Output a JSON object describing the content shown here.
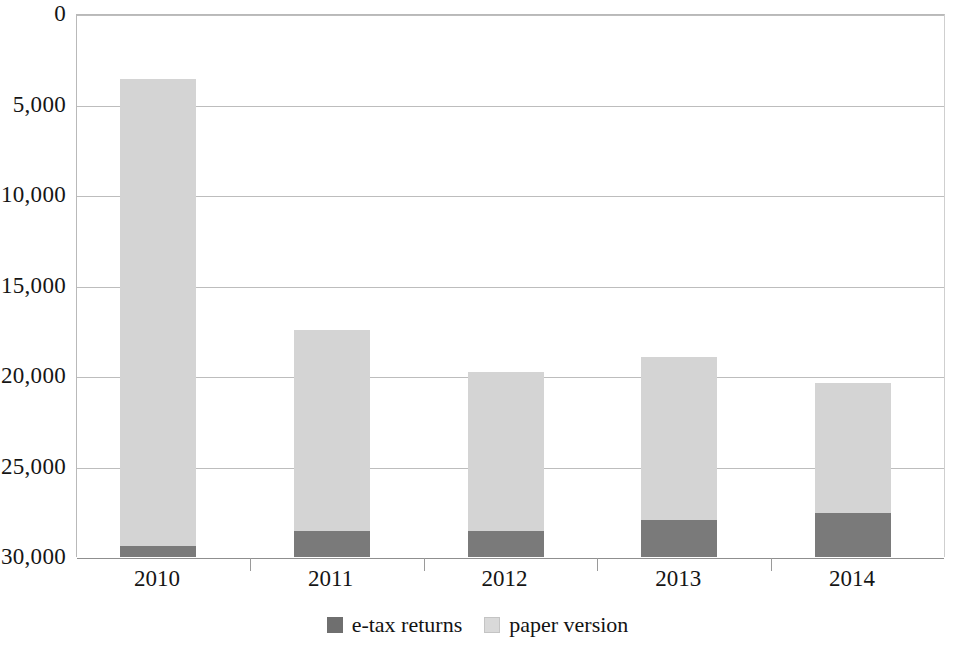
{
  "chart_data": {
    "type": "bar",
    "subtype": "stacked-bar",
    "title": "",
    "subtitle": "",
    "xlabel": "",
    "ylabel": "",
    "categories": [
      "2010",
      "2011",
      "2012",
      "2013",
      "2014"
    ],
    "series": [
      {
        "name": "e-tax returns",
        "color": "#7a7a7a",
        "values": [
          600,
          1440,
          1440,
          2040,
          2430
        ]
      },
      {
        "name": "paper version",
        "color": "#d4d4d4",
        "values": [
          25800,
          11100,
          8780,
          9010,
          7180
        ]
      }
    ],
    "totals": [
      26400,
      12540,
      10220,
      11050,
      9610
    ],
    "ylim": [
      0,
      30000
    ],
    "ytick_values": [
      0,
      5000,
      10000,
      15000,
      20000,
      25000,
      30000
    ],
    "ytick_labels": [
      "0",
      "5,000",
      "10,000",
      "15,000",
      "20,000",
      "25,000",
      "30,000"
    ],
    "grid": true,
    "legend_position": "bottom",
    "legend_entries": [
      {
        "label": "e-tax returns",
        "swatch": "etax"
      },
      {
        "label": "paper version",
        "swatch": "paper"
      }
    ]
  },
  "axes": {
    "y": {
      "ticks": [
        {
          "label": "30,000",
          "value": 30000
        },
        {
          "label": "25,000",
          "value": 25000
        },
        {
          "label": "20,000",
          "value": 20000
        },
        {
          "label": "15,000",
          "value": 15000
        },
        {
          "label": "10,000",
          "value": 10000
        },
        {
          "label": "5,000",
          "value": 5000
        },
        {
          "label": "0",
          "value": 0
        }
      ]
    },
    "x": {
      "ticks": [
        {
          "label": "2010"
        },
        {
          "label": "2011"
        },
        {
          "label": "2012"
        },
        {
          "label": "2013"
        },
        {
          "label": "2014"
        }
      ]
    }
  },
  "colors": {
    "etax": "#7a7a7a",
    "paper": "#d4d4d4",
    "grid": "#bdbdbd",
    "axis": "#8f8f8f",
    "background": "#ffffff",
    "text": "#151515"
  }
}
